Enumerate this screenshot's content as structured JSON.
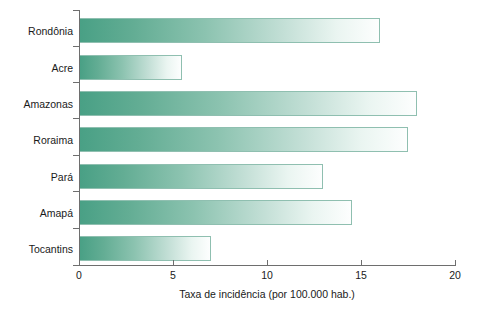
{
  "chart_data": {
    "type": "bar",
    "orientation": "horizontal",
    "title": "",
    "xlabel": "Taxa de incidência (por 100.000 hab.)",
    "ylabel": "",
    "categories": [
      "Rondônia",
      "Acre",
      "Amazonas",
      "Roraima",
      "Pará",
      "Amapá",
      "Tocantins"
    ],
    "values": [
      16.0,
      5.5,
      18.0,
      17.5,
      13.0,
      14.5,
      7.0
    ],
    "xlim": [
      0,
      20
    ],
    "xticks": [
      0,
      5,
      10,
      15,
      20
    ],
    "xtick_labels": [
      "0",
      "5",
      "10",
      "15",
      "20"
    ],
    "grid": false,
    "legend": null,
    "bar_fill": {
      "gradient_from": "#49a085",
      "gradient_to": "#fdfefe",
      "border": "#8fbfb0"
    },
    "axis_color": "#6e6e6e"
  }
}
